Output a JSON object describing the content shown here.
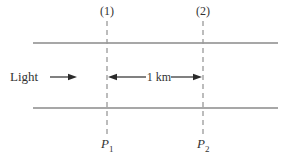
{
  "diagram": {
    "top_markers": {
      "marker1": "(1)",
      "marker2": "(2)"
    },
    "bottom_points": {
      "p1": {
        "base": "P",
        "sub": "1"
      },
      "p2": {
        "base": "P",
        "sub": "2"
      }
    },
    "light_label": "Light",
    "distance_label": "1 km",
    "colors": {
      "boundary_line": "#8a8a8a",
      "dashed_line": "#999999",
      "text": "#333333",
      "arrow": "#2b2b2b",
      "background": "#ffffff"
    }
  }
}
